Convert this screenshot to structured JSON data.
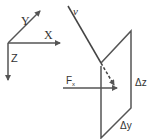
{
  "axes": {
    "x_label": "X",
    "y_label": "Y",
    "z_label": "Z"
  },
  "vector": {
    "label": "v"
  },
  "force": {
    "main": "F",
    "sub": "x"
  },
  "plane": {
    "dz_label": "Δz",
    "dy_label": "Δy"
  },
  "colors": {
    "line": "#555555",
    "background": "#ffffff"
  }
}
